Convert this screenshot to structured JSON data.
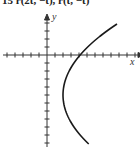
{
  "header": {
    "text": "15 r(2t, −t), r(t, −t)"
  },
  "chart_data": {
    "type": "line",
    "title": "",
    "xlabel": "x",
    "ylabel": "y",
    "grid": false,
    "axis_origin_px": [
      47,
      55
    ],
    "tick_spacing_px": 8,
    "x_ticks_left": 5,
    "x_ticks_right": 11,
    "y_ticks_up": 4,
    "y_ticks_down": 11,
    "curve": {
      "description": "sideways parabola opening right",
      "vertex_px": [
        63,
        95
      ],
      "x_intercept_px": [
        78,
        55
      ],
      "top_end_px": [
        117,
        24
      ],
      "bottom_end_px": [
        117,
        144
      ]
    }
  },
  "labels": {
    "x_axis": "x",
    "y_axis": "y"
  },
  "colors": {
    "axis": "#333333",
    "curve": "#1a1a1a"
  }
}
